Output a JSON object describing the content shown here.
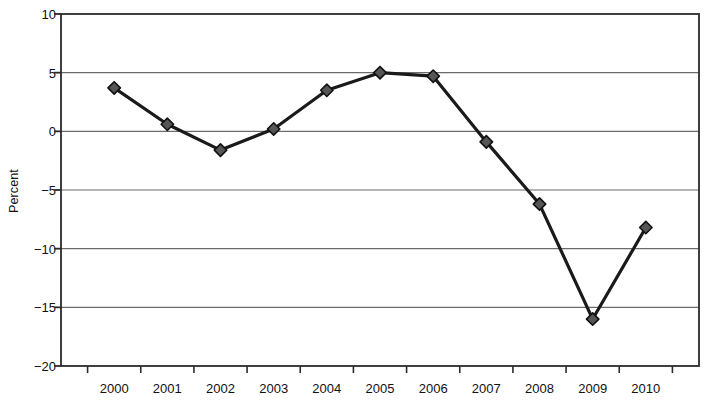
{
  "chart_data": {
    "type": "line",
    "title": "",
    "xlabel": "",
    "ylabel": "Percent",
    "categories": [
      "2000",
      "2001",
      "2002",
      "2003",
      "2004",
      "2005",
      "2006",
      "2007",
      "2008",
      "2009",
      "2010"
    ],
    "values": [
      3.7,
      0.6,
      -1.6,
      0.2,
      3.5,
      5.0,
      4.7,
      -0.9,
      -6.2,
      -16.0,
      -8.2
    ],
    "series": [
      {
        "name": "Percent",
        "values": [
          3.7,
          0.6,
          -1.6,
          0.2,
          3.5,
          5.0,
          4.7,
          -0.9,
          -6.2,
          -16.0,
          -8.2
        ]
      }
    ],
    "ylim": [
      -20,
      10
    ],
    "yticks": [
      10,
      5,
      0,
      -5,
      -10,
      -15,
      -20
    ],
    "ytick_labels": [
      "10",
      "5",
      "0",
      "−5",
      "−10",
      "−15",
      "−20"
    ],
    "grid": "horizontal",
    "legend": "none",
    "marker": "diamond",
    "line_color": "#1a1a1a",
    "marker_fill": "#565656",
    "marker_stroke": "#111111",
    "grid_color": "#6b6b6b",
    "frame_color": "#2b2b2b",
    "background": "#ffffff"
  }
}
